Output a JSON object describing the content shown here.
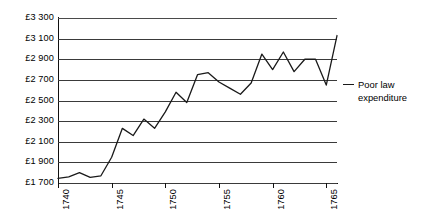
{
  "chart_data": {
    "type": "line",
    "title": "",
    "xlabel": "",
    "ylabel": "",
    "ylim": [
      1700,
      3300
    ],
    "xlim": [
      1740,
      1766
    ],
    "grid": true,
    "legend_position": "right",
    "currency_symbol": "£",
    "y_ticks": [
      "£3 300",
      "£3 100",
      "£2 900",
      "£2 700",
      "£2 500",
      "£2 300",
      "£2 100",
      "£1 900",
      "£1 700"
    ],
    "y_tick_values": [
      3300,
      3100,
      2900,
      2700,
      2500,
      2300,
      2100,
      1900,
      1700
    ],
    "x_ticks": [
      "1740",
      "1745",
      "1750",
      "1755",
      "1760",
      "1765"
    ],
    "x_tick_values": [
      1740,
      1745,
      1750,
      1755,
      1760,
      1765
    ],
    "x": [
      1740,
      1741,
      1742,
      1743,
      1744,
      1745,
      1746,
      1747,
      1748,
      1749,
      1750,
      1751,
      1752,
      1753,
      1754,
      1755,
      1756,
      1757,
      1758,
      1759,
      1760,
      1761,
      1762,
      1763,
      1764,
      1765,
      1766
    ],
    "series": [
      {
        "name": "Poor law expenditure",
        "color": "#1a1a1a",
        "values": [
          1745,
          1760,
          1800,
          1755,
          1770,
          1950,
          2230,
          2160,
          2320,
          2230,
          2390,
          2580,
          2480,
          2750,
          2770,
          2680,
          2620,
          2560,
          2670,
          2950,
          2800,
          2970,
          2780,
          2900,
          2900,
          2650,
          3130
        ]
      }
    ],
    "legend": [
      {
        "label_line1": "Poor law",
        "label_line2": "expenditure",
        "label": "Poor law\nexpenditure"
      }
    ]
  }
}
